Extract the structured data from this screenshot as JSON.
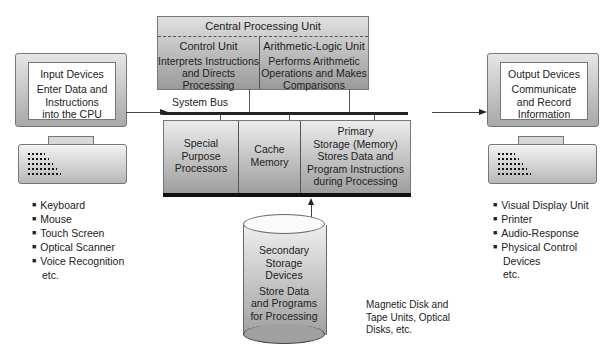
{
  "cpu": {
    "title": "Central Processing Unit",
    "control_unit": {
      "title": "Control Unit",
      "description_lines": [
        "Interprets Instructions",
        "and Directs Processing"
      ]
    },
    "alu": {
      "title": "Arithmetic-Logic Unit",
      "description_lines": [
        "Performs Arithmetic",
        "Operations and Makes",
        "Comparisons"
      ]
    }
  },
  "system_bus": {
    "label": "System Bus"
  },
  "memory_row": {
    "special_purpose": [
      "Special",
      "Purpose",
      "Processors"
    ],
    "cache": [
      "Cache",
      "Memory"
    ],
    "primary_storage": [
      "Primary",
      "Storage (Memory)",
      "Stores Data and",
      "Program Instructions",
      "during Processing"
    ]
  },
  "input_devices": {
    "title": "Input Devices",
    "description_lines": [
      "Enter Data and",
      "Instructions",
      "into the CPU"
    ],
    "examples": [
      "Keyboard",
      "Mouse",
      "Touch Screen",
      "Optical Scanner",
      "Voice Recognition"
    ],
    "etc": "etc."
  },
  "output_devices": {
    "title": "Output Devices",
    "description_lines": [
      "Communicate",
      "and Record",
      "Information"
    ],
    "examples": [
      "Visual Display Unit",
      "Printer",
      "Audio-Response",
      "Physical Control"
    ],
    "continuation": "Devices",
    "etc": "etc."
  },
  "secondary_storage": {
    "title_lines": [
      "Secondary",
      "Storage",
      "Devices"
    ],
    "description_lines": [
      "Store Data",
      "and Programs",
      "for Processing"
    ],
    "examples_lines": [
      "Magnetic Disk and",
      "Tape Units, Optical",
      "Disks, etc."
    ]
  }
}
